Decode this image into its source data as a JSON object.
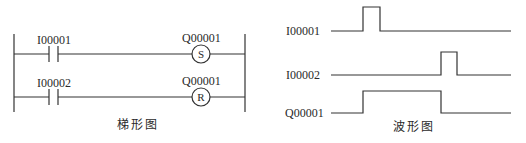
{
  "ladder": {
    "caption": "梯形图",
    "rungs": [
      {
        "contact": {
          "label": "I00001",
          "type": "normally-open"
        },
        "coil": {
          "label": "Q00001",
          "type": "S"
        }
      },
      {
        "contact": {
          "label": "I00002",
          "type": "normally-open"
        },
        "coil": {
          "label": "Q00001",
          "type": "R"
        }
      }
    ]
  },
  "waveform": {
    "caption": "波形图",
    "signals": [
      {
        "label": "I00001",
        "transitions": "low -> pulse high -> low"
      },
      {
        "label": "I00002",
        "transitions": "low -> pulse high (later) -> low"
      },
      {
        "label": "Q00001",
        "transitions": "goes high at I00001 pulse, low at I00002 pulse"
      }
    ]
  },
  "colors": {
    "line": "#333333",
    "background": "#ffffff"
  }
}
